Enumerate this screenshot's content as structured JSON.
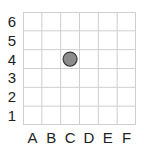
{
  "grid": {
    "columns": [
      "A",
      "B",
      "C",
      "D",
      "E",
      "F"
    ],
    "rows": [
      "6",
      "5",
      "4",
      "3",
      "2",
      "1"
    ],
    "line_color": "#cfcfcf"
  },
  "markers": [
    {
      "column": "C",
      "row": "4",
      "shape": "circle",
      "fill": "#8c8c8c",
      "stroke": "#3a3a3a"
    }
  ]
}
